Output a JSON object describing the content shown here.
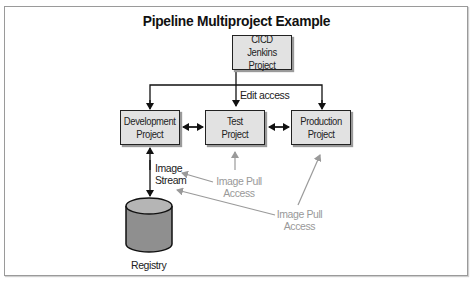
{
  "title": "Pipeline Multiproject Example",
  "nodes": {
    "cicd": "CICD Jenkins\nProject",
    "development": "Development\nProject",
    "test": "Test\nProject",
    "production": "Production\nProject",
    "registry": "Registry"
  },
  "edges": {
    "edit_access": "Edit access",
    "image_stream": "Image\nStream",
    "image_pull_test": "Image Pull\nAccess",
    "image_pull_prod": "Image Pull\nAccess"
  },
  "colors": {
    "box_fill": "#e2e2e2",
    "line": "#111111",
    "pull_arrow": "#9a9a9a",
    "cylinder_top": "#b5b5b5",
    "cylinder_body": "#8f8f8f"
  }
}
